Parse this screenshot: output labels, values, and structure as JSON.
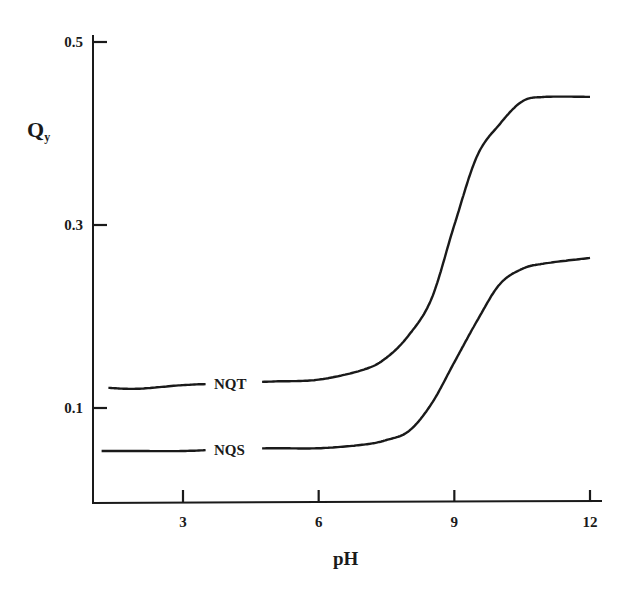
{
  "chart_data": {
    "type": "line",
    "title": "",
    "xlabel": "pH",
    "ylabel": "Q_y",
    "ylabel_main": "Q",
    "ylabel_sub": "y",
    "xlim": [
      1,
      12.5
    ],
    "ylim": [
      0,
      0.52
    ],
    "grid": false,
    "legend": "inline curve labels",
    "x_ticks": [
      3,
      6,
      9,
      12
    ],
    "x_tick_labels": [
      "3",
      "6",
      "9",
      "12"
    ],
    "y_ticks": [
      0.1,
      0.3,
      0.5
    ],
    "y_tick_labels": [
      "0.1",
      "0.3",
      "0.5"
    ],
    "series": [
      {
        "name": "NQT",
        "x": [
          1.35,
          2.0,
          3.0,
          4.0,
          5.0,
          6.0,
          7.0,
          7.5,
          8.0,
          8.5,
          9.0,
          9.5,
          10.0,
          10.5,
          11.0,
          12.0
        ],
        "y": [
          0.122,
          0.121,
          0.125,
          0.127,
          0.129,
          0.131,
          0.142,
          0.155,
          0.18,
          0.22,
          0.3,
          0.375,
          0.41,
          0.435,
          0.44,
          0.44
        ]
      },
      {
        "name": "NQS",
        "x": [
          1.2,
          2.0,
          3.0,
          4.0,
          5.0,
          6.0,
          7.0,
          7.5,
          8.0,
          8.5,
          9.0,
          9.5,
          10.0,
          10.5,
          11.0,
          12.0
        ],
        "y": [
          0.053,
          0.053,
          0.053,
          0.055,
          0.056,
          0.056,
          0.06,
          0.065,
          0.075,
          0.105,
          0.15,
          0.195,
          0.235,
          0.252,
          0.258,
          0.264
        ]
      }
    ],
    "annotations": [
      {
        "text": "NQT",
        "x": 5.0,
        "y": 0.128
      },
      {
        "text": "NQS",
        "x": 5.0,
        "y": 0.056
      }
    ]
  },
  "labels": {
    "xlabel": "pH",
    "ylabel_main": "Q",
    "ylabel_sub": "y",
    "series_1": "NQT",
    "series_2": "NQS"
  }
}
